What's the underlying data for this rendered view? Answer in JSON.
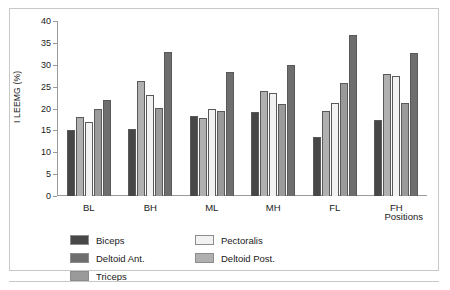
{
  "figure": {
    "xaxis_title": "Positions"
  },
  "chart_data": {
    "type": "bar",
    "title": "",
    "xlabel": "Positions",
    "ylabel": "I LEEMG (%)",
    "ylim": [
      0,
      40
    ],
    "yticks": [
      0,
      5,
      10,
      15,
      20,
      25,
      30,
      35,
      40
    ],
    "ytick_labels": [
      "0",
      "5",
      "10",
      "15",
      "20",
      "25",
      "30",
      "35",
      "40"
    ],
    "grid": false,
    "legend_position": "below-axes",
    "categories": [
      "BL",
      "BH",
      "ML",
      "MH",
      "FL",
      "FH"
    ],
    "series": [
      {
        "name": "Biceps",
        "color": "#474747",
        "values": [
          15.0,
          15.4,
          18.4,
          19.1,
          13.4,
          17.4
        ]
      },
      {
        "name": "Deltoid Post.",
        "color": "#b0b0b0",
        "values": [
          18.0,
          26.4,
          17.9,
          24.0,
          19.5,
          27.9
        ]
      },
      {
        "name": "Pectoralis",
        "color": "#f2f2f2",
        "values": [
          17.0,
          23.1,
          19.9,
          23.5,
          21.3,
          27.4
        ]
      },
      {
        "name": "Triceps",
        "color": "#9a9a9a",
        "values": [
          20.0,
          20.1,
          19.5,
          21.0,
          25.8,
          21.3
        ]
      },
      {
        "name": "Deltoid Ant.",
        "color": "#6e6e6e",
        "values": [
          22.0,
          33.0,
          28.3,
          30.0,
          36.8,
          32.7
        ]
      }
    ],
    "legend_order": [
      "Biceps",
      "Pectoralis",
      "Deltoid Ant.",
      "Deltoid Post.",
      "Triceps"
    ]
  }
}
